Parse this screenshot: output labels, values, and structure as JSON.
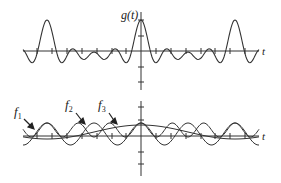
{
  "chart_data": [
    {
      "type": "line",
      "title": "",
      "ylabel": "g(t)",
      "xlabel": "t",
      "grid": false,
      "legend": null,
      "series": [
        {
          "name": "g(t)",
          "description": "sum of f1 + f2 + f3; tall peaks at t=0 and t=±2 periods of f2, smaller peaks in between"
        }
      ],
      "x_ticks_count": 12,
      "y_ticks_count": 4,
      "axis_origin_px": [
        141,
        51
      ]
    },
    {
      "type": "line",
      "title": "",
      "xlabel": "t",
      "grid": false,
      "series": [
        {
          "name": "f1",
          "description": "lowest frequency cosine, longest period"
        },
        {
          "name": "f2",
          "description": "medium frequency cosine, largest amplitude"
        },
        {
          "name": "f3",
          "description": "highest frequency cosine"
        }
      ],
      "annotations": [
        "f1",
        "f2",
        "f3"
      ],
      "axis_origin_px": [
        141,
        136
      ]
    }
  ],
  "top": {
    "ylabel": "g(t)",
    "xlabel": "t"
  },
  "bottom": {
    "xlabel": "t",
    "labels": {
      "f1": "f",
      "f1_sub": "1",
      "f2": "f",
      "f2_sub": "2",
      "f3": "f",
      "f3_sub": "3"
    }
  },
  "colors": {
    "stroke": "#333333",
    "background": "#ffffff"
  }
}
